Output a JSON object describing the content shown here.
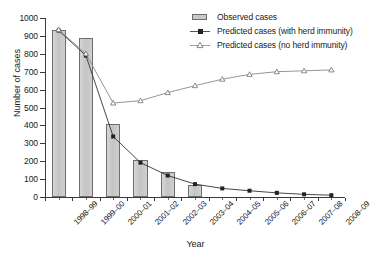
{
  "chart_data": {
    "type": "bar",
    "title": "",
    "xlabel": "Year",
    "ylabel": "Number of cases",
    "ylim": [
      0,
      1000
    ],
    "ytick_step": 100,
    "yticks": [
      0,
      100,
      200,
      300,
      400,
      500,
      600,
      700,
      800,
      900,
      1000
    ],
    "grid": false,
    "legend_position": "top-right",
    "categories": [
      "1998–99",
      "1999–00",
      "2000–01",
      "2001–02",
      "2002–03",
      "2003–04",
      "2004–05",
      "2005–06",
      "2006–07",
      "2007–08",
      "2008–09"
    ],
    "series": [
      {
        "name": "Observed cases",
        "type": "bar",
        "color": "#c9c9c9",
        "edge_color": "#6e6e6e",
        "values": [
          935,
          890,
          410,
          208,
          140,
          68,
          null,
          null,
          null,
          null,
          null
        ]
      },
      {
        "name": "Predicted cases (with herd immunity)",
        "type": "line",
        "marker": "filled-square",
        "color": "#333333",
        "values": [
          930,
          790,
          338,
          192,
          120,
          72,
          48,
          35,
          23,
          15,
          10
        ]
      },
      {
        "name": "Predicted cases (no herd immunity)",
        "type": "line",
        "marker": "open-triangle",
        "color": "#8a8a8a",
        "values": [
          935,
          800,
          525,
          538,
          583,
          622,
          658,
          685,
          700,
          705,
          710
        ]
      }
    ]
  },
  "axes": {
    "y_title": "Number of cases",
    "x_title": "Year"
  },
  "legend": {
    "items": [
      {
        "label": "Observed cases",
        "key": "bar-swatch-icon"
      },
      {
        "label": "Predicted cases (with herd immunity)",
        "key": "line-square-marker-icon"
      },
      {
        "label": "Predicted cases (no herd immunity)",
        "key": "line-triangle-marker-icon"
      }
    ]
  }
}
